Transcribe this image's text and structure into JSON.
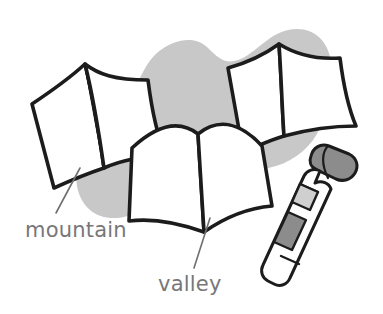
{
  "figure": {
    "background_color": "#ffffff",
    "blob_color": "#c8c8c8",
    "ink_color": "#1c1c1c",
    "paper_color": "#ffffff",
    "label_color": "#77777a",
    "cap_fill": "#8c8c8c",
    "glue_band_dark": "#8c8c8c",
    "glue_band_light": "#cfcfcf"
  },
  "labels": {
    "mountain": "mountain",
    "valley": "valley"
  },
  "objects": {
    "paper_left_name": "mountain-fold-paper-left",
    "paper_right_name": "mountain-fold-paper-right",
    "paper_center_name": "valley-fold-paper-center",
    "glue_stick_name": "glue-stick",
    "glue_cap_name": "glue-stick-cap",
    "blob_name": "grey-background-blob"
  }
}
